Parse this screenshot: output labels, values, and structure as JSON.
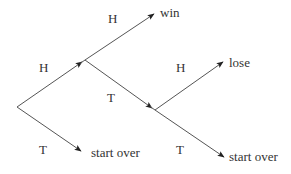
{
  "diagram": {
    "type": "probability-tree",
    "nodes": {
      "root": {
        "x": 17,
        "y": 107
      },
      "a": {
        "x": 85,
        "y": 60
      },
      "b": {
        "x": 155,
        "y": 110
      }
    },
    "edge_labels": {
      "root_to_a": "H",
      "a_to_win": "H",
      "a_to_b": "T",
      "b_to_lose": "H",
      "b_to_start_over": "T",
      "root_to_start_over": "T"
    },
    "outcomes": {
      "win": "win",
      "lose": "lose",
      "start_over_1": "start over",
      "start_over_2": "start over"
    },
    "colors": {
      "line": "#555555",
      "text": "#333333",
      "background": "#ffffff"
    }
  }
}
